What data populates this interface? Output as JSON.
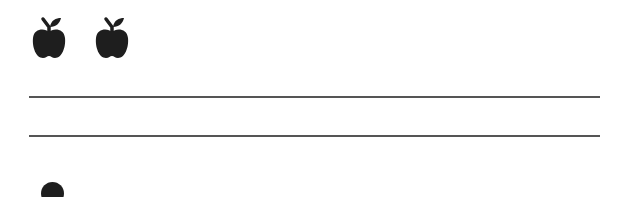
{
  "worksheet": {
    "title": "Counting apples worksheet",
    "apples": [
      {
        "icon": "apple-icon",
        "color": "#1e1e1e"
      },
      {
        "icon": "apple-icon",
        "color": "#1e1e1e"
      }
    ],
    "apple_count": 2,
    "writing_lines": 2,
    "line_color": "#555555",
    "bottom_item": {
      "icon": "circle-icon",
      "partially_visible": true
    }
  }
}
